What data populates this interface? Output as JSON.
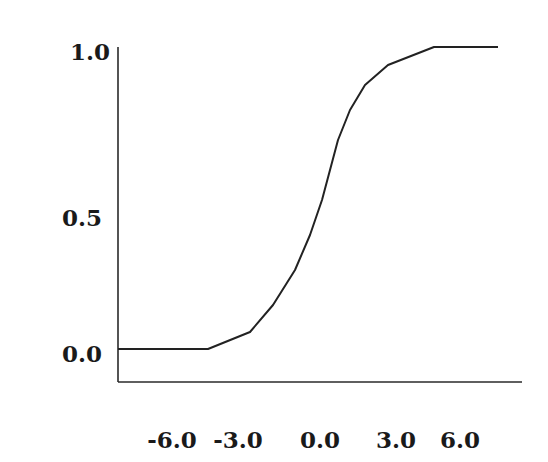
{
  "chart_data": {
    "type": "line",
    "title": "",
    "xlabel": "",
    "ylabel": "",
    "grid": false,
    "legend": null,
    "xlim": [
      -8.5,
      8.5
    ],
    "ylim": [
      -0.1,
      1.0
    ],
    "x_ticks": [
      "-6.0",
      "-3.0",
      "0.0",
      "3.0",
      "6.0"
    ],
    "y_ticks": [
      "1.0",
      "0.5",
      "0.0"
    ],
    "series": [
      {
        "name": "sigmoid",
        "x": [
          -8.4,
          -5.6,
          -3.7,
          -2.6,
          -1.6,
          -0.9,
          -0.4,
          0.0,
          0.4,
          0.9,
          1.6,
          2.7,
          4.8,
          7.7
        ],
        "values": [
          0.01,
          0.01,
          0.06,
          0.15,
          0.26,
          0.38,
          0.49,
          0.59,
          0.69,
          0.79,
          0.87,
          0.94,
          1.0,
          1.0
        ]
      }
    ]
  },
  "render": {
    "y_axis": {
      "x": 118,
      "y_top": 47,
      "y_bottom": 382
    },
    "x_axis": {
      "y": 382,
      "x_left": 118,
      "x_right": 522
    },
    "y_tick_positions": [
      {
        "label": "1.0",
        "x": 90,
        "y": 60
      },
      {
        "label": "0.5",
        "x": 82,
        "y": 226
      },
      {
        "label": "0.0",
        "x": 82,
        "y": 362
      }
    ],
    "x_tick_positions": [
      {
        "label": "-6.0",
        "x": 172,
        "y": 448
      },
      {
        "label": "-3.0",
        "x": 238,
        "y": 448
      },
      {
        "label": "0.0",
        "x": 320,
        "y": 448
      },
      {
        "label": "3.0",
        "x": 396,
        "y": 448
      },
      {
        "label": "6.0",
        "x": 460,
        "y": 448
      }
    ],
    "curve_points": "118,349 208,349 250,332 273,305 295,270 310,235 322,200 330,170 338,140 350,110 365,85 388,65 434,47 498,47"
  }
}
